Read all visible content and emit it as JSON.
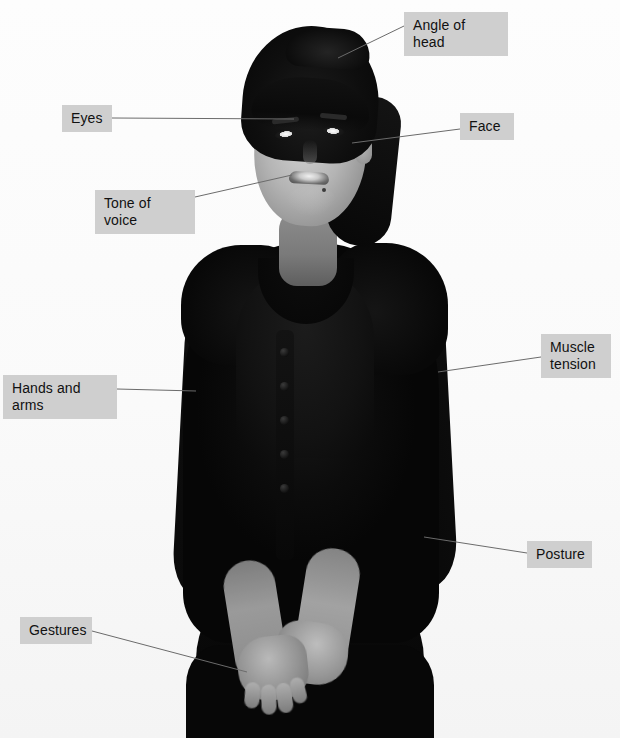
{
  "figure": {
    "alt_description": "Grayscale photograph of a smiling woman standing with hands clasped in front of her, wearing a dark cardigan over a dark top and skirt",
    "background_color": "#ffffff",
    "photo_style": "black-and-white"
  },
  "callouts": {
    "label_bg": "#cfcfcf",
    "label_text_color": "#111111",
    "line_color": "#6b6b6b",
    "items": [
      {
        "id": "angle-of-head",
        "label": "Angle of head",
        "box": {
          "x": 404,
          "y": 12,
          "w": 104,
          "h": 27
        },
        "line": {
          "x1": 404,
          "y1": 26,
          "x2": 338,
          "y2": 58
        }
      },
      {
        "id": "eyes",
        "label": "Eyes",
        "box": {
          "x": 62,
          "y": 105,
          "w": 50,
          "h": 27
        },
        "line": {
          "x1": 112,
          "y1": 118,
          "x2": 294,
          "y2": 119
        }
      },
      {
        "id": "face",
        "label": "Face",
        "box": {
          "x": 460,
          "y": 113,
          "w": 54,
          "h": 27
        },
        "line": {
          "x1": 460,
          "y1": 129,
          "x2": 352,
          "y2": 143
        }
      },
      {
        "id": "tone-of-voice",
        "label": "Tone of voice",
        "box": {
          "x": 95,
          "y": 190,
          "w": 100,
          "h": 27
        },
        "line": {
          "x1": 195,
          "y1": 197,
          "x2": 292,
          "y2": 175
        }
      },
      {
        "id": "muscle-tension",
        "label": "Muscle tension",
        "box": {
          "x": 541,
          "y": 334,
          "w": 70,
          "h": 44
        },
        "line": {
          "x1": 541,
          "y1": 357,
          "x2": 438,
          "y2": 372
        }
      },
      {
        "id": "hands-and-arms",
        "label": "Hands and arms",
        "box": {
          "x": 3,
          "y": 375,
          "w": 114,
          "h": 27
        },
        "line": {
          "x1": 117,
          "y1": 389,
          "x2": 196,
          "y2": 391
        }
      },
      {
        "id": "posture",
        "label": "Posture",
        "box": {
          "x": 527,
          "y": 541,
          "w": 65,
          "h": 27
        },
        "line": {
          "x1": 527,
          "y1": 553,
          "x2": 424,
          "y2": 537
        }
      },
      {
        "id": "gestures",
        "label": "Gestures",
        "box": {
          "x": 20,
          "y": 617,
          "w": 72,
          "h": 27
        },
        "line": {
          "x1": 92,
          "y1": 631,
          "x2": 247,
          "y2": 672
        }
      }
    ]
  }
}
